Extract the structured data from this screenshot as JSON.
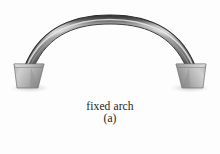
{
  "figure": {
    "caption_title": "fixed arch",
    "caption_subtitle": "(a)",
    "background_color": "#fdfdfd",
    "text_color": "#1c1c1c"
  },
  "diagram": {
    "type": "engineering-schematic",
    "subject": "fixed arch",
    "arch": {
      "label": "arch-rib",
      "shape": "segmental",
      "span_left_x": 25,
      "span_right_x": 195,
      "crown_y": 17,
      "springing_y": 66,
      "band_thickness": 9,
      "color_top_edge": "#3a3a3a",
      "color_highlight": "#d8d8d8",
      "color_body": "#8c8c8c",
      "color_bottom_edge": "#4a4a4a"
    },
    "supports": [
      {
        "label": "left-abutment",
        "side": "left",
        "shape": "trapezoid",
        "top_x": 30,
        "top_y": 62,
        "base_y": 88,
        "color_light": "#cfcfcf",
        "color_dark": "#8f8f8f"
      },
      {
        "label": "right-abutment",
        "side": "right",
        "shape": "trapezoid",
        "top_x": 190,
        "top_y": 62,
        "base_y": 88,
        "color_light": "#cfcfcf",
        "color_dark": "#8f8f8f"
      }
    ]
  }
}
